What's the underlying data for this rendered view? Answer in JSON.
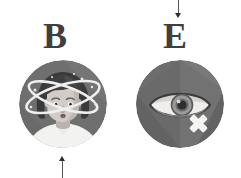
{
  "figure": {
    "width": 241,
    "height": 178,
    "background": "#ffffff",
    "style": "grayscale flat-illustration medical symptom icons with leader lines"
  },
  "panels": [
    {
      "key": "b",
      "label": "B",
      "label_color": "#3f3f3f",
      "icon_name": "dizziness-vertigo-icon",
      "icon_description": "circular grey badge containing a woman's head and shoulders with crossing elliptical swirl rings and sparkle dots around her head indicating dizziness",
      "leader": {
        "name": "leader-line-bottom",
        "direction": "up",
        "position": "below-icon"
      }
    },
    {
      "key": "e",
      "label": "E",
      "label_color": "#3f3f3f",
      "icon_name": "vision-loss-icon",
      "icon_description": "circular grey badge containing a stylised eye with a white cross (X) mark at the lower right indicating loss of vision",
      "leader": {
        "name": "leader-line-top",
        "direction": "down",
        "position": "above-icon"
      }
    }
  ],
  "colors": {
    "badge_base": "#6f6f6f",
    "badge_light": "#7d7d7d",
    "badge_dark": "#636363",
    "badge_darker": "#5b5b5b",
    "label_text": "#3f3f3f",
    "leader_line": "#555555",
    "leader_head": "#2e2e2e",
    "skin_light": "#d6d0cb",
    "skin_mid": "#bdb6b1",
    "skin_shadow": "#a39c97",
    "hair_dark": "#3a3a3a",
    "hair_mid": "#4c4c4c",
    "shirt_white": "#f2f2f0",
    "swirl_white": "#efefed",
    "eye_white": "#e8e8e6",
    "iris_grey": "#8c8c8c",
    "pupil_dark": "#3b3b3b",
    "cross_white": "#f4f4f2"
  },
  "icons": {
    "dizzy": {
      "name": "dizziness-vertigo-icon",
      "parts": [
        "badge-circle",
        "hair",
        "face",
        "eyes",
        "eyebrows",
        "nose",
        "mouth",
        "neck",
        "shirt",
        "swirl-ring-1",
        "swirl-ring-2",
        "sparkle-dots"
      ]
    },
    "eye": {
      "name": "vision-loss-icon",
      "parts": [
        "badge-circle",
        "facet-shading",
        "eye-outline",
        "eye-white",
        "iris",
        "pupil",
        "highlight",
        "lower-lid-shadow",
        "cross-mark"
      ]
    }
  }
}
